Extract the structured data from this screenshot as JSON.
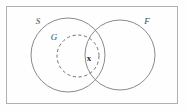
{
  "figure": {
    "background_color": "#fefefe",
    "frame": {
      "name": "outer-frame",
      "x": 6.5,
      "y": 6.5,
      "width": 171,
      "height": 97,
      "stroke": "#b0b0b0"
    },
    "sets": [
      {
        "id": "S",
        "label": "S",
        "style": "solid",
        "stroke": "#8a8a8a",
        "cx": 68,
        "cy": 55,
        "r": 37,
        "label_x": 38,
        "label_y": 24
      },
      {
        "id": "F",
        "label": "F",
        "style": "solid",
        "stroke": "#8a8a8a",
        "cx": 120,
        "cy": 55,
        "r": 35,
        "label_x": 147,
        "label_y": 24
      },
      {
        "id": "G",
        "label": "G",
        "style": "dashed",
        "stroke": "#6f6f6f",
        "cx": 78,
        "cy": 56,
        "r": 21,
        "label_x": 54,
        "label_y": 40
      }
    ],
    "points": [
      {
        "id": "x",
        "label": "x",
        "x": 89,
        "y": 61,
        "region": "intersection-of-S-F-G"
      }
    ]
  }
}
